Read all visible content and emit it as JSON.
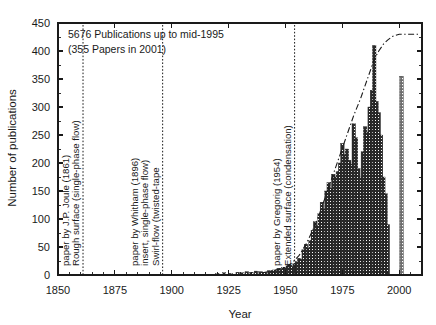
{
  "chart_data": {
    "type": "bar",
    "title": "",
    "xlabel": "Year",
    "ylabel": "Number of publications",
    "xlim": [
      1850,
      2010
    ],
    "ylim": [
      0,
      450
    ],
    "ytick_step": 50,
    "xtick_step": 25,
    "yticks": [
      0,
      50,
      100,
      150,
      200,
      250,
      300,
      350,
      400,
      450
    ],
    "xticks": [
      1850,
      1875,
      1900,
      1925,
      1950,
      1975,
      2000
    ],
    "grid": false,
    "legend": "none",
    "bar_fill": "#3d3d3d",
    "series": [
      {
        "name": "Publications per year",
        "x": [
          1920,
          1923,
          1926,
          1929,
          1931,
          1933,
          1935,
          1937,
          1939,
          1941,
          1943,
          1944,
          1945,
          1946,
          1947,
          1948,
          1949,
          1950,
          1951,
          1952,
          1953,
          1954,
          1955,
          1956,
          1957,
          1958,
          1959,
          1960,
          1961,
          1962,
          1963,
          1964,
          1965,
          1966,
          1967,
          1968,
          1969,
          1970,
          1971,
          1972,
          1973,
          1974,
          1975,
          1976,
          1977,
          1978,
          1979,
          1980,
          1981,
          1982,
          1983,
          1984,
          1985,
          1986,
          1987,
          1988,
          1989,
          1990,
          1991,
          1992,
          1993,
          1994,
          1995,
          2001
        ],
        "values": [
          3,
          4,
          3,
          5,
          4,
          6,
          5,
          7,
          6,
          5,
          8,
          7,
          9,
          8,
          12,
          10,
          14,
          13,
          16,
          18,
          15,
          20,
          24,
          30,
          28,
          45,
          55,
          48,
          62,
          80,
          95,
          88,
          110,
          130,
          118,
          150,
          165,
          155,
          180,
          175,
          185,
          200,
          235,
          215,
          225,
          205,
          198,
          270,
          245,
          190,
          175,
          220,
          265,
          255,
          300,
          330,
          410,
          310,
          290,
          250,
          175,
          145,
          90,
          355
        ]
      }
    ],
    "cumulative_curve": {
      "name": "Cumulative publications (right-hand trend)",
      "x": [
        1940,
        1945,
        1950,
        1953,
        1956,
        1959,
        1962,
        1965,
        1968,
        1971,
        1974,
        1977,
        1980,
        1983,
        1986,
        1989,
        1991,
        1993,
        1995,
        1997,
        2000,
        2005,
        2009
      ],
      "values": [
        4,
        8,
        14,
        22,
        35,
        55,
        80,
        110,
        145,
        180,
        215,
        250,
        285,
        315,
        350,
        385,
        400,
        412,
        420,
        426,
        430,
        430,
        430
      ]
    },
    "annotations": [
      {
        "id": "joule",
        "year": 1861,
        "lines": [
          "Rough surface (single-phase flow)",
          "paper by J.P. Joule (1861)"
        ]
      },
      {
        "id": "whitham",
        "year": 1896,
        "lines": [
          "Swirl-flow (twisted-tape",
          "insert, single-phase flow)",
          "paper by Whitham (1896)"
        ]
      },
      {
        "id": "gregorig",
        "year": 1954,
        "lines": [
          "Extended surface (condensation)",
          "paper by Gregorig (1954)"
        ]
      }
    ],
    "captions": [
      "5676 Publications up to mid-1995",
      "(355 Papers in 2001)"
    ]
  }
}
